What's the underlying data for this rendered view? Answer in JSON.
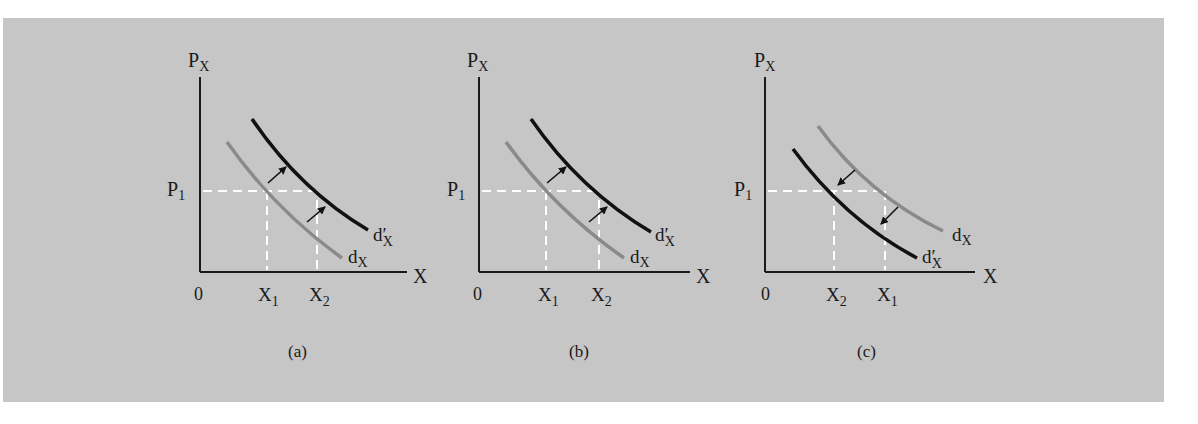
{
  "figure": {
    "background_color": "#c6c6c6",
    "panels": [
      {
        "id": "a",
        "caption": "(a)",
        "y_axis_label": "P",
        "y_axis_sub": "X",
        "x_axis_label": "X",
        "origin_label": "0",
        "price_label": "P",
        "price_sub": "1",
        "x_tick_left": {
          "main": "X",
          "sub": "1"
        },
        "x_tick_right": {
          "main": "X",
          "sub": "2"
        },
        "gray_curve_label": {
          "main": "d",
          "sub": "X"
        },
        "black_curve_label": {
          "main": "d′",
          "sub": "X"
        },
        "shift": "right"
      },
      {
        "id": "b",
        "caption": "(b)",
        "y_axis_label": "P",
        "y_axis_sub": "X",
        "x_axis_label": "X",
        "origin_label": "0",
        "price_label": "P",
        "price_sub": "1",
        "x_tick_left": {
          "main": "X",
          "sub": "1"
        },
        "x_tick_right": {
          "main": "X",
          "sub": "2"
        },
        "gray_curve_label": {
          "main": "d",
          "sub": "X"
        },
        "black_curve_label": {
          "main": "d′",
          "sub": "X"
        },
        "shift": "right"
      },
      {
        "id": "c",
        "caption": "(c)",
        "y_axis_label": "P",
        "y_axis_sub": "X",
        "x_axis_label": "X",
        "origin_label": "0",
        "price_label": "P",
        "price_sub": "1",
        "x_tick_left": {
          "main": "X",
          "sub": "2"
        },
        "x_tick_right": {
          "main": "X",
          "sub": "1"
        },
        "gray_curve_label": {
          "main": "d",
          "sub": "X"
        },
        "black_curve_label": {
          "main": "d′",
          "sub": "X"
        },
        "shift": "left"
      }
    ]
  }
}
